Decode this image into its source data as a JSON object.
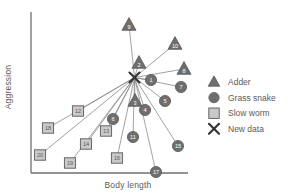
{
  "chart_data": {
    "type": "scatter",
    "title": "",
    "xlabel": "Body length",
    "ylabel": "Aggression",
    "grid": false,
    "axes": {
      "x_ticks": [],
      "y_ticks": [],
      "note": "Unlabelled qualitative axes; arrows/spokes connect each reference specimen to the new data point"
    },
    "legend": {
      "position": "right",
      "entries": [
        {
          "label": "Adder",
          "marker": "triangle",
          "color": "#6e6e6e"
        },
        {
          "label": "Grass snake",
          "marker": "circle",
          "color": "#6e6e6e"
        },
        {
          "label": "Slow worm",
          "marker": "square",
          "color": "#c9c9c9"
        },
        {
          "label": "New data",
          "marker": "x-cross",
          "color": "#3a3a3a"
        }
      ]
    },
    "new_data_point": {
      "label": "X",
      "x": 134.5,
      "y": 77.5
    },
    "points": [
      {
        "id": "1",
        "group": "Grass snake",
        "marker": "circle",
        "x": 151,
        "y": 80
      },
      {
        "id": "2",
        "group": "Adder",
        "marker": "triangle",
        "x": 139,
        "y": 63
      },
      {
        "id": "3",
        "group": "Adder",
        "marker": "triangle",
        "x": 135,
        "y": 101
      },
      {
        "id": "4",
        "group": "Grass snake",
        "marker": "circle",
        "x": 145,
        "y": 110
      },
      {
        "id": "5",
        "group": "Grass snake",
        "marker": "circle",
        "x": 165,
        "y": 101
      },
      {
        "id": "6",
        "group": "Grass snake",
        "marker": "circle",
        "x": 113,
        "y": 119
      },
      {
        "id": "7",
        "group": "Grass snake",
        "marker": "circle",
        "x": 181,
        "y": 87
      },
      {
        "id": "8",
        "group": "Adder",
        "marker": "triangle",
        "x": 184,
        "y": 69
      },
      {
        "id": "9",
        "group": "Adder",
        "marker": "triangle",
        "x": 129,
        "y": 25
      },
      {
        "id": "10",
        "group": "Adder",
        "marker": "triangle",
        "x": 175,
        "y": 44
      },
      {
        "id": "11",
        "group": "Grass snake",
        "marker": "circle",
        "x": 133,
        "y": 137
      },
      {
        "id": "12",
        "group": "Slow worm",
        "marker": "square",
        "x": 78,
        "y": 111
      },
      {
        "id": "13",
        "group": "Slow worm",
        "marker": "square",
        "x": 106,
        "y": 131
      },
      {
        "id": "14",
        "group": "Slow worm",
        "marker": "square",
        "x": 86,
        "y": 144
      },
      {
        "id": "15",
        "group": "Grass snake",
        "marker": "circle",
        "x": 178,
        "y": 146
      },
      {
        "id": "16",
        "group": "Slow worm",
        "marker": "square",
        "x": 117,
        "y": 158
      },
      {
        "id": "17",
        "group": "Grass snake",
        "marker": "circle",
        "x": 156,
        "y": 172
      },
      {
        "id": "18",
        "group": "Slow worm",
        "marker": "square",
        "x": 48,
        "y": 128
      },
      {
        "id": "19",
        "group": "Slow worm",
        "marker": "square",
        "x": 70,
        "y": 163
      },
      {
        "id": "20",
        "group": "Slow worm",
        "marker": "square",
        "x": 40,
        "y": 155
      }
    ]
  },
  "colors": {
    "axis": "#6f6f6f",
    "marker_dark": "#6e6e6e",
    "marker_light": "#c9c9c9",
    "marker_stroke": "#5a5a5a",
    "line": "#8a8a8a",
    "text": "#5a5a5a",
    "cross": "#333333"
  }
}
